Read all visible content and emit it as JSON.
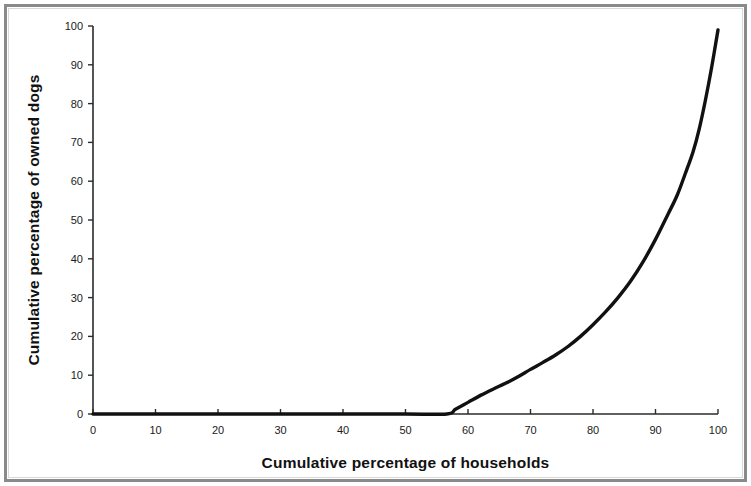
{
  "figure": {
    "background_color": "#ffffff",
    "frame_color": "#8a8a8a",
    "curve_color": "#111111",
    "axis_color": "#2b2b2b"
  },
  "chart_data": {
    "type": "line",
    "title": "",
    "subtitle": "",
    "xlabel": "Cumulative percentage of households",
    "ylabel": "Cumulative percentage of owned dogs",
    "xlim": [
      0,
      100
    ],
    "ylim": [
      0,
      100
    ],
    "xticks": [
      0,
      10,
      20,
      30,
      40,
      50,
      60,
      70,
      80,
      90,
      100
    ],
    "yticks": [
      0,
      10,
      20,
      30,
      40,
      50,
      60,
      70,
      80,
      90,
      100
    ],
    "xtick_labels": [
      "0",
      "10",
      "20",
      "30",
      "40",
      "50",
      "60",
      "70",
      "80",
      "90",
      "100"
    ],
    "ytick_labels": [
      "0",
      "10",
      "20",
      "30",
      "40",
      "50",
      "60",
      "70",
      "80",
      "90",
      "100"
    ],
    "grid": false,
    "legend": false,
    "legend_position": "none",
    "series": [
      {
        "name": "Cumulative dog ownership",
        "color": "#111111",
        "line_width": 3.4,
        "x": [
          0,
          10,
          20,
          30,
          40,
          50,
          56.6,
          58,
          60,
          62,
          64,
          66,
          68,
          70,
          72,
          74,
          76,
          78,
          80,
          82,
          84,
          86,
          88,
          90,
          92,
          93.5,
          95,
          96,
          97,
          98,
          99,
          100
        ],
        "y": [
          0,
          0,
          0,
          0,
          0,
          0,
          0,
          1.2,
          3.0,
          4.8,
          6.4,
          7.9,
          9.6,
          11.5,
          13.3,
          15.2,
          17.4,
          20.0,
          23.0,
          26.3,
          30.0,
          34.2,
          39.2,
          45.0,
          51.5,
          56.5,
          63.0,
          67.5,
          73.5,
          81.0,
          89.5,
          99.0
        ]
      }
    ],
    "annotations": []
  },
  "axis_titles": {
    "x": "Cumulative percentage of households",
    "y": "Cumulative percentage of owned dogs"
  }
}
